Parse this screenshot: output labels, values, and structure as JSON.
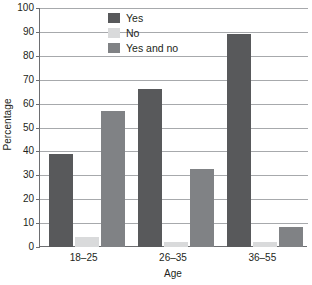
{
  "chart_data": {
    "type": "bar",
    "title": "",
    "xlabel": "Age",
    "ylabel": "Percentage",
    "categories": [
      "18–25",
      "26–35",
      "36–55"
    ],
    "series": [
      {
        "name": "Yes",
        "color": "#58595b",
        "values": [
          39,
          66,
          89
        ]
      },
      {
        "name": "No",
        "color": "#d9dadb",
        "values": [
          4,
          2,
          2
        ]
      },
      {
        "name": "Yes and no",
        "color": "#808285",
        "values": [
          57,
          32.5,
          8.5
        ]
      }
    ],
    "ylim": [
      0,
      100
    ],
    "ytick_labels": [
      "0",
      "10",
      "20",
      "30",
      "40",
      "50",
      "60",
      "70",
      "80",
      "90",
      "100"
    ],
    "ytick_values": [
      0,
      10,
      20,
      30,
      40,
      50,
      60,
      70,
      80,
      90,
      100
    ],
    "grid": true,
    "grid_axis": "y",
    "legend_position": "top-center",
    "axis_color": "#6d6e71",
    "grid_color": "#a7a9ac",
    "background": "#ffffff"
  }
}
